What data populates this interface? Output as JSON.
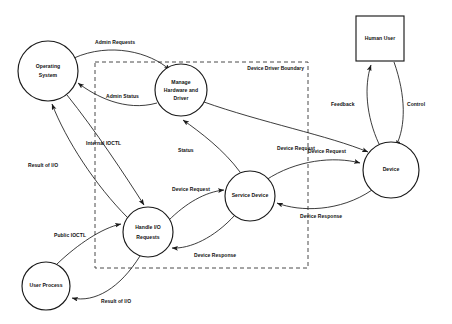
{
  "diagram": {
    "boundary": {
      "label": "Device Driver Boundary",
      "style": "dashed"
    },
    "nodes": [
      {
        "id": "operating-system",
        "label_line1": "Operating",
        "label_line2": "System",
        "shape": "circle",
        "cx": 48,
        "cy": 71,
        "r": 30
      },
      {
        "id": "manage-hardware-and-driver",
        "label_line1": "Manage",
        "label_line2": "Hardware and",
        "label_line3": "Driver",
        "shape": "circle",
        "cx": 181,
        "cy": 90,
        "r": 26
      },
      {
        "id": "handle-io-requests",
        "label_line1": "Handle I/O",
        "label_line2": "Requests",
        "shape": "circle",
        "cx": 148,
        "cy": 232,
        "r": 25
      },
      {
        "id": "service-device",
        "label_line1": "Service Device",
        "shape": "circle",
        "cx": 250,
        "cy": 196,
        "r": 25
      },
      {
        "id": "device",
        "label_line1": "Device",
        "shape": "circle",
        "cx": 391,
        "cy": 170,
        "r": 28
      },
      {
        "id": "user-process",
        "label_line1": "User Process",
        "shape": "circle",
        "cx": 46,
        "cy": 286,
        "r": 24
      },
      {
        "id": "human-user",
        "label_line1": "Human User",
        "shape": "rectangle",
        "x": 356,
        "y": 16,
        "width": 48,
        "height": 45
      }
    ],
    "edges": [
      {
        "id": "admin-requests",
        "label": "Admin Requests",
        "from": "operating-system",
        "to": "manage-hardware-and-driver"
      },
      {
        "id": "admin-status",
        "label": "Admin Status",
        "from": "manage-hardware-and-driver",
        "to": "operating-system"
      },
      {
        "id": "internal-ioctl",
        "label": "Internal IOCTL",
        "from": "operating-system",
        "to": "handle-io-requests"
      },
      {
        "id": "result-of-io-os",
        "label": "Result of I/O",
        "from": "handle-io-requests",
        "to": "operating-system"
      },
      {
        "id": "public-ioctl",
        "label": "Public IOCTL",
        "from": "user-process",
        "to": "handle-io-requests"
      },
      {
        "id": "result-of-io-user",
        "label": "Result of I/O",
        "from": "handle-io-requests",
        "to": "user-process"
      },
      {
        "id": "status",
        "label": "Status",
        "from": "service-device",
        "to": "manage-hardware-and-driver"
      },
      {
        "id": "device-request-driver",
        "label": "Device Request",
        "from": "handle-io-requests",
        "to": "service-device"
      },
      {
        "id": "device-response-driver",
        "label": "Device Response",
        "from": "service-device",
        "to": "handle-io-requests"
      },
      {
        "id": "device-request-manage",
        "label": "Device Request",
        "from": "manage-hardware-and-driver",
        "to": "device"
      },
      {
        "id": "device-request-service",
        "label": "Device Request",
        "from": "service-device",
        "to": "device"
      },
      {
        "id": "device-response-service",
        "label": "Device Response",
        "from": "device",
        "to": "service-device"
      },
      {
        "id": "feedback",
        "label": "Feedback",
        "from": "device",
        "to": "human-user"
      },
      {
        "id": "control",
        "label": "Control",
        "from": "human-user",
        "to": "device"
      }
    ],
    "colors": {
      "stroke": "#1a1a1a",
      "text": "#111111",
      "background": "#ffffff",
      "boundary": "#4a4a4a"
    }
  }
}
